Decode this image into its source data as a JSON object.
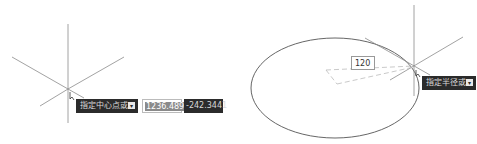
{
  "left_panel": {
    "prompt_text": "指定中心点或",
    "prompt_icon": "arrow-down-icon",
    "x_value": "1236.4896",
    "y_value": "-242.3441"
  },
  "right_panel": {
    "prompt_text": "指定半径或",
    "prompt_icon": "arrow-down-icon",
    "radius_value": "120"
  },
  "colors": {
    "tooltip_bg": "#2b2b2b",
    "line": "#888888",
    "ellipse": "#555555"
  }
}
